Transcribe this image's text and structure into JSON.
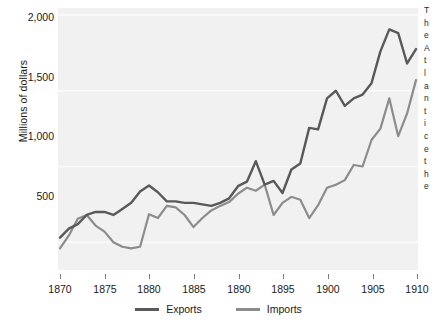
{
  "axes": {
    "ylabel": "Millions of dollars",
    "yticks": [
      "500",
      "1,000",
      "1,500",
      "2,000"
    ],
    "xticks": [
      "1870",
      "1875",
      "1880",
      "1885",
      "1890",
      "1895",
      "1900",
      "1905",
      "1910"
    ]
  },
  "legend": {
    "items": [
      {
        "label": "Exports",
        "color": "#595959"
      },
      {
        "label": "Imports",
        "color": "#8c8c8c"
      }
    ]
  },
  "side_text": {
    "lines": [
      "T",
      "h",
      "e",
      "A",
      "t",
      "l",
      "a",
      "n",
      "t",
      "i",
      "c",
      "e",
      "t",
      "h",
      "e",
      "i",
      "n",
      "a",
      "t"
    ]
  },
  "colors": {
    "plot_background": "#f1f1f1",
    "gridline": "#fbfbfb",
    "exports": "#595959",
    "imports": "#8c8c8c",
    "tick": "#7a7a7a",
    "text": "#1a1a1a"
  },
  "chart_data": {
    "type": "line",
    "title": "",
    "xlabel": "",
    "ylabel": "Millions of dollars",
    "xlim": [
      1870,
      1910
    ],
    "ylim": [
      330,
      2000
    ],
    "yticks": [
      500,
      1000,
      1500,
      2000
    ],
    "xticks": [
      1870,
      1875,
      1880,
      1885,
      1890,
      1895,
      1900,
      1905,
      1910
    ],
    "grid": true,
    "legend_position": "bottom-center",
    "x": [
      1870,
      1871,
      1872,
      1873,
      1874,
      1875,
      1876,
      1877,
      1878,
      1879,
      1880,
      1881,
      1882,
      1883,
      1884,
      1885,
      1886,
      1887,
      1888,
      1889,
      1890,
      1891,
      1892,
      1893,
      1894,
      1895,
      1896,
      1897,
      1898,
      1899,
      1900,
      1901,
      1902,
      1903,
      1904,
      1905,
      1906,
      1907,
      1908,
      1909,
      1910
    ],
    "series": [
      {
        "name": "Exports",
        "color": "#595959",
        "values": [
          530,
          590,
          620,
          680,
          700,
          700,
          680,
          720,
          760,
          835,
          875,
          830,
          770,
          770,
          760,
          760,
          750,
          740,
          760,
          790,
          870,
          900,
          1035,
          880,
          905,
          825,
          980,
          1020,
          1255,
          1245,
          1450,
          1500,
          1400,
          1450,
          1475,
          1550,
          1760,
          1905,
          1880,
          1680,
          1775
        ]
      },
      {
        "name": "Imports",
        "color": "#8c8c8c",
        "values": [
          460,
          545,
          655,
          680,
          610,
          570,
          500,
          470,
          460,
          470,
          685,
          660,
          740,
          730,
          680,
          600,
          660,
          710,
          740,
          765,
          820,
          860,
          840,
          880,
          680,
          760,
          800,
          780,
          660,
          745,
          860,
          880,
          910,
          1010,
          1000,
          1175,
          1250,
          1450,
          1200,
          1350,
          1570
        ]
      }
    ]
  }
}
